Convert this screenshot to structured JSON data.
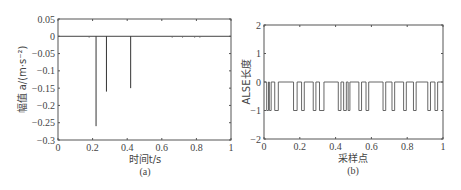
{
  "chart_data": [
    {
      "id": "a",
      "type": "line",
      "title": "",
      "caption": "(a)",
      "xlabel": "时间t/s",
      "ylabel": "幅值 a/(m·s⁻²)",
      "xlim": [
        0,
        1
      ],
      "ylim": [
        -0.3,
        0.05
      ],
      "xticks": [
        0,
        0.2,
        0.4,
        0.6,
        0.8,
        1
      ],
      "xtick_labels": [
        "0",
        "0.2",
        "0.4",
        "0.6",
        "0.8",
        "1"
      ],
      "yticks": [
        0.05,
        0,
        -0.05,
        -0.1,
        -0.15,
        -0.2,
        -0.25,
        -0.3
      ],
      "ytick_labels": [
        "0.05",
        "0",
        "−0.05",
        "−0.1",
        "−0.15",
        "−0.2",
        "−0.25",
        "−0.3"
      ],
      "grid": false,
      "baseline": 0,
      "spikes": [
        {
          "x": 0.22,
          "y": -0.26
        },
        {
          "x": 0.28,
          "y": -0.16
        },
        {
          "x": 0.42,
          "y": -0.15
        }
      ],
      "small_noise_x": [
        0.18,
        0.66,
        0.72,
        0.79,
        0.82
      ]
    },
    {
      "id": "b",
      "type": "line",
      "title": "",
      "caption": "(b)",
      "xlabel": "采样点",
      "ylabel": "ALSE长度",
      "xlim": [
        0,
        1
      ],
      "ylim": [
        -2,
        2
      ],
      "xticks": [
        0,
        0.2,
        0.4,
        0.6,
        0.8,
        1
      ],
      "xtick_labels": [
        "0",
        "0.2",
        "0.4",
        "0.6",
        "0.8",
        "1"
      ],
      "yticks": [
        2,
        1,
        0,
        -1,
        -2
      ],
      "ytick_labels": [
        "2",
        "1",
        "0",
        "−1",
        "−2"
      ],
      "grid": false,
      "description": "Binary square pulse train switching between 0 and -1",
      "pulses_to_minus1": [
        [
          0.015,
          0.025
        ],
        [
          0.03,
          0.04
        ],
        [
          0.06,
          0.08
        ],
        [
          0.165,
          0.185
        ],
        [
          0.21,
          0.225
        ],
        [
          0.275,
          0.29
        ],
        [
          0.31,
          0.335
        ],
        [
          0.415,
          0.43
        ],
        [
          0.445,
          0.46
        ],
        [
          0.47,
          0.48
        ],
        [
          0.53,
          0.545
        ],
        [
          0.57,
          0.585
        ],
        [
          0.665,
          0.68
        ],
        [
          0.715,
          0.73
        ],
        [
          0.78,
          0.795
        ],
        [
          0.835,
          0.85
        ],
        [
          0.915,
          0.93
        ],
        [
          0.955,
          0.97
        ]
      ]
    }
  ]
}
